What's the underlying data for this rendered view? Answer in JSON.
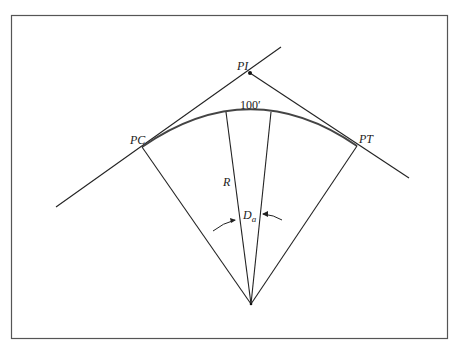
{
  "figure": {
    "type": "circular-curve-diagram",
    "labels": {
      "pi": "PI",
      "pc": "PC",
      "pt": "PT",
      "radius": "R",
      "arc_length": "100′",
      "degree_of_curve": "D",
      "degree_subscript": "a"
    },
    "colors": {
      "frame": "#555555",
      "lines": "#222222",
      "arc": "#444444",
      "background": "#ffffff"
    }
  }
}
